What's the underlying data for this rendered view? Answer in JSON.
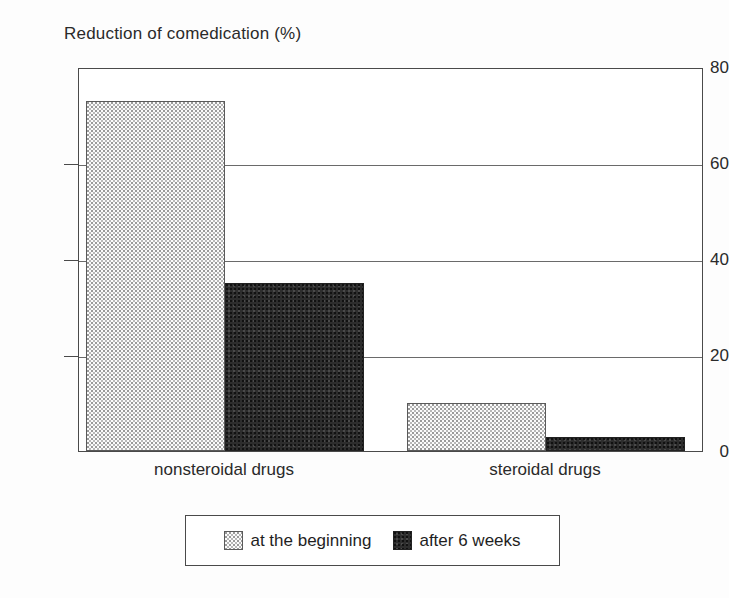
{
  "chart_data": {
    "type": "bar",
    "title": "Reduction of comedication (%)",
    "xlabel": "",
    "ylabel": "Reduction of comedication (%)",
    "categories": [
      "nonsteroidal drugs",
      "steroidal drugs"
    ],
    "series": [
      {
        "name": "at the beginning",
        "values": [
          73,
          10
        ],
        "color": "#fbfbfb",
        "pattern": "fine-dotted"
      },
      {
        "name": "after 6 weeks",
        "values": [
          35,
          3
        ],
        "color": "#2d2d2d",
        "pattern": "solid-dark"
      }
    ],
    "ylim": [
      0,
      80
    ],
    "yticks": [
      0,
      20,
      40,
      60,
      80
    ],
    "ytick_labels": [
      "0",
      "20",
      "40",
      "60",
      "80"
    ],
    "grid": true,
    "grid_axis": "y",
    "legend_position": "bottom-center",
    "legend_entries": [
      "at the beginning",
      "after 6 weeks"
    ]
  },
  "axes": {
    "y_ticks": [
      {
        "label": "80",
        "value": 80
      },
      {
        "label": "60",
        "value": 60
      },
      {
        "label": "40",
        "value": 40
      },
      {
        "label": "20",
        "value": 20
      },
      {
        "label": "0",
        "value": 0
      }
    ],
    "x_ticks": [
      {
        "label": "nonsteroidal drugs"
      },
      {
        "label": "steroidal drugs"
      }
    ]
  },
  "legend": {
    "items": [
      {
        "label": "at the beginning",
        "swatch": "light-dotted-swatch"
      },
      {
        "label": "after 6 weeks",
        "swatch": "dark-solid-swatch"
      }
    ]
  }
}
